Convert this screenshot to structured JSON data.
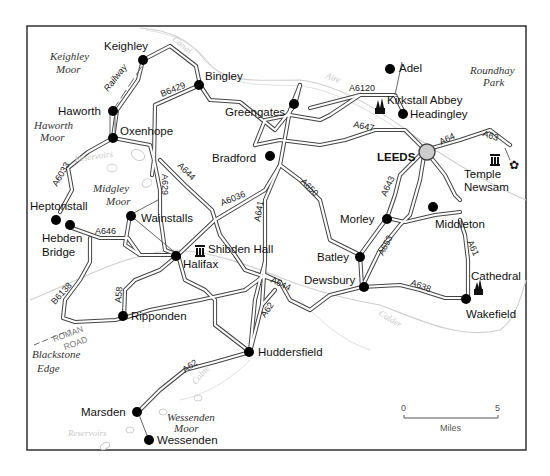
{
  "map": {
    "title": "Leeds, Bradford and Halifax area",
    "colors": {
      "frame": "#222222",
      "road_casing": "#444444",
      "town_dot": "#000000",
      "city_circle_fill": "#cccccc",
      "river": "#cfcfcf"
    },
    "towns": {
      "keighley": "Keighley",
      "bingley": "Bingley",
      "haworth": "Haworth",
      "oxenhope": "Oxenhope",
      "greengates": "Greengates",
      "adel": "Adel",
      "headingley": "Headingley",
      "kirkstall_abbey": "Kirkstall Abbey",
      "bradford": "Bradford",
      "leeds": "LEEDS",
      "temple": "Temple",
      "newsam": "Newsam",
      "heptonstall": "Heptonstall",
      "hebden": "Hebden",
      "bridge": "Bridge",
      "wainstalls": "Wainstalls",
      "halifax": "Halifax",
      "shibden_hall": "Shibden Hall",
      "morley": "Morley",
      "middleton": "Middleton",
      "batley": "Batley",
      "dewsbury": "Dewsbury",
      "cathedral": "Cathedral",
      "wakefield": "Wakefield",
      "ripponden": "Ripponden",
      "huddersfield": "Huddersfield",
      "marsden": "Marsden",
      "wessenden": "Wessenden"
    },
    "areas": {
      "keighley_moor_1": "Keighley",
      "keighley_moor_2": "Moor",
      "haworth_moor_1": "Haworth",
      "haworth_moor_2": "Moor",
      "midgley_moor_1": "Midgley",
      "midgley_moor_2": "Moor",
      "roundhay_1": "Roundhay",
      "roundhay_2": "Park",
      "blackstone_1": "Blackstone",
      "blackstone_2": "Edge",
      "wessenden_moor_1": "Wessenden",
      "wessenden_moor_2": "Moor"
    },
    "faint": {
      "canal": "Canal",
      "aire": "Aire",
      "reservoirs_top": "Reservoirs",
      "reservoirs_bottom": "Reservoirs",
      "calder": "Calder",
      "colne": "Colne"
    },
    "roads": {
      "railway": "Railway",
      "b6429": "B6429",
      "a6120": "A6120",
      "a647": "A647",
      "a64": "A64",
      "a63": "A63",
      "a6033": "A6033",
      "a629": "A629",
      "a644_north": "A644",
      "a6036": "A6036",
      "a641": "A641",
      "a650": "A650",
      "a643": "A643",
      "a646": "A646",
      "a653": "A653",
      "a61": "A61",
      "b6138": "B6138",
      "a58": "A58",
      "a644_south": "A644",
      "a62_mid": "A62",
      "a638": "A638",
      "a62_south": "A62",
      "roman_1": "ROMAN",
      "roman_2": "ROAD"
    },
    "scale": {
      "start": "0",
      "end": "5",
      "unit": "Miles"
    }
  }
}
